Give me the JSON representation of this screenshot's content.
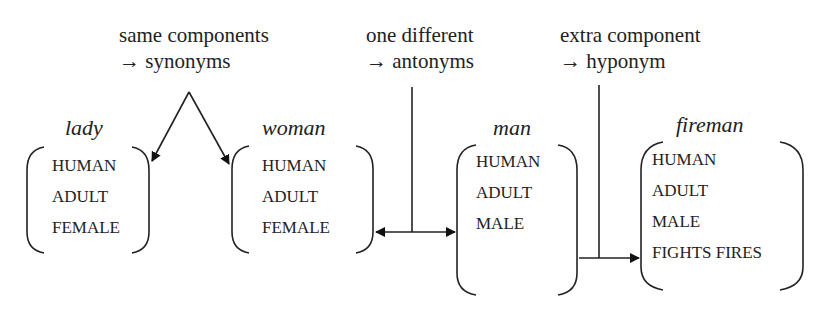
{
  "annotations": [
    {
      "line1": "same components",
      "line2": "→ synonyms"
    },
    {
      "line1": "one different",
      "line2": "→ antonyms"
    },
    {
      "line1": "extra component",
      "line2": "→ hyponym"
    }
  ],
  "entries": [
    {
      "word": "lady",
      "features": [
        "HUMAN",
        "ADULT",
        "FEMALE"
      ]
    },
    {
      "word": "woman",
      "features": [
        "HUMAN",
        "ADULT",
        "FEMALE"
      ]
    },
    {
      "word": "man",
      "features": [
        "HUMAN",
        "ADULT",
        "MALE"
      ]
    },
    {
      "word": "fireman",
      "features": [
        "HUMAN",
        "ADULT",
        "MALE",
        "FIGHTS FIRES"
      ]
    }
  ],
  "relations": [
    {
      "from": "lady",
      "to": "woman",
      "type": "synonyms"
    },
    {
      "from": "woman",
      "to": "man",
      "type": "antonyms"
    },
    {
      "from": "man",
      "to": "fireman",
      "type": "hyponym"
    }
  ]
}
